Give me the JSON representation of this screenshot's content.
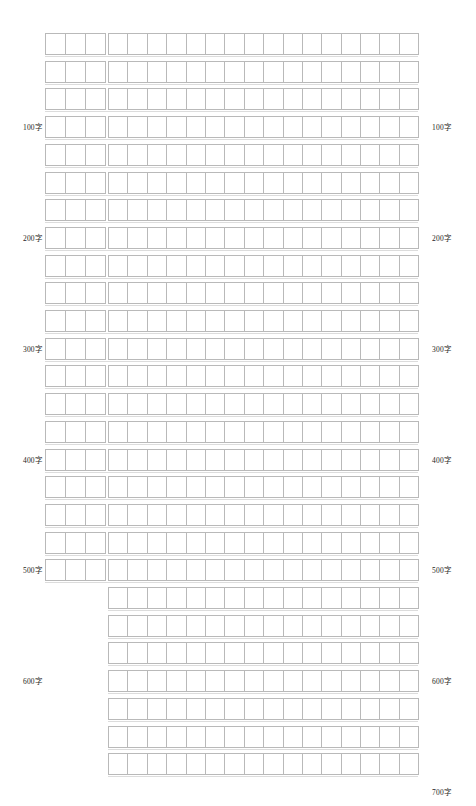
{
  "page": {
    "width": 476,
    "height": 806,
    "background_color": "#ffffff",
    "grid_line_color": "#b9b9b9",
    "text_color": "#1e1e1e"
  },
  "grid": {
    "row_count": 27,
    "row_pitch": 27.7,
    "row_height": 22,
    "first_row_top": 33,
    "left_block": {
      "columns": 3,
      "cell_width": 20,
      "left": 45,
      "row_start": 1,
      "row_end": 20
    },
    "right_block": {
      "columns": 16,
      "cell_width": 19.4,
      "left": 108,
      "row_start": 1,
      "row_end": 27
    }
  },
  "labels": {
    "unit": "字",
    "left_side": [
      {
        "text": "100字",
        "row": 4
      },
      {
        "text": "200字",
        "row": 8
      },
      {
        "text": "300字",
        "row": 12
      },
      {
        "text": "400字",
        "row": 16
      },
      {
        "text": "500字",
        "row": 20
      },
      {
        "text": "600字",
        "row": 24
      }
    ],
    "right_side": [
      {
        "text": "100字",
        "row": 4
      },
      {
        "text": "200字",
        "row": 8
      },
      {
        "text": "300字",
        "row": 12
      },
      {
        "text": "400字",
        "row": 16
      },
      {
        "text": "500字",
        "row": 20
      },
      {
        "text": "600字",
        "row": 24
      },
      {
        "text": "700字",
        "row": 28
      },
      {
        "text": "800字",
        "row": 32
      }
    ]
  }
}
